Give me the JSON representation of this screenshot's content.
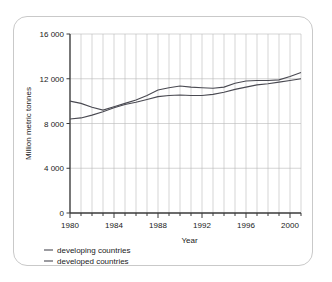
{
  "chart_data": {
    "type": "line",
    "title": "",
    "xlabel": "Year",
    "ylabel": "Million metric tonnes",
    "xlim": [
      1980,
      2001
    ],
    "ylim": [
      0,
      16000
    ],
    "grid": "both-minor-vertical-major-horizontal",
    "legend_position": "below-left",
    "y_ticks": [
      0,
      4000,
      8000,
      12000,
      16000
    ],
    "y_tick_labels": [
      "0",
      "4 000",
      "8 000",
      "12 000",
      "16 000"
    ],
    "x_ticks": [
      1980,
      1984,
      1988,
      1992,
      1996,
      2000
    ],
    "x_tick_labels": [
      "1980",
      "1984",
      "1988",
      "1992",
      "1996",
      "2000"
    ],
    "x": [
      1980,
      1981,
      1982,
      1983,
      1984,
      1985,
      1986,
      1987,
      1988,
      1989,
      1990,
      1991,
      1992,
      1993,
      1994,
      1995,
      1996,
      1997,
      1998,
      1999,
      2000,
      2001
    ],
    "series": [
      {
        "name": "developing countries",
        "values": [
          8400,
          8500,
          8750,
          9050,
          9400,
          9700,
          9900,
          10150,
          10400,
          10500,
          10550,
          10500,
          10500,
          10600,
          10800,
          11050,
          11250,
          11450,
          11550,
          11700,
          11850,
          12000
        ]
      },
      {
        "name": "developed countries",
        "values": [
          10000,
          9800,
          9450,
          9200,
          9500,
          9800,
          10100,
          10500,
          11000,
          11200,
          11350,
          11250,
          11200,
          11150,
          11250,
          11600,
          11800,
          11850,
          11850,
          11900,
          12200,
          12550
        ]
      }
    ],
    "colors": {
      "series_line": "#4a4a52",
      "gridline": "#b9b9b9",
      "axis": "#3a3a3a",
      "text": "#1a1a1a",
      "card_border": "#c9c9c9",
      "background": "#ffffff"
    }
  },
  "legend": {
    "items": [
      {
        "label": "developing countries"
      },
      {
        "label": "developed countries"
      }
    ]
  },
  "axes": {
    "y_title": "Million metric tonnes",
    "x_title": "Year"
  }
}
